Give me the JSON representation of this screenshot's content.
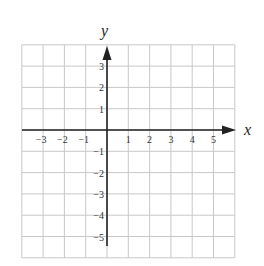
{
  "diagram": {
    "type": "coordinate-plane",
    "x_axis_label": "x",
    "y_axis_label": "y",
    "x_ticks": [
      "-3",
      "-2",
      "-1",
      "1",
      "2",
      "3",
      "4",
      "5"
    ],
    "y_ticks": [
      "3",
      "2",
      "1",
      "-1",
      "-2",
      "-3",
      "-4",
      "-5"
    ],
    "x_range": [
      -4,
      6
    ],
    "y_range": [
      -6,
      4
    ],
    "grid": true,
    "colors": {
      "grid": "#c8c8c8",
      "axis": "#222222",
      "text": "#333333"
    }
  }
}
